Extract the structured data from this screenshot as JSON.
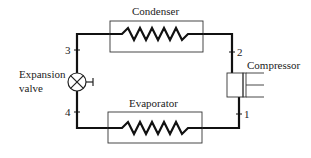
{
  "diagram": {
    "type": "refrigeration-cycle",
    "components": {
      "condenser": "Condenser",
      "evaporator": "Evaporator",
      "compressor": "Compressor",
      "expansion_valve_line1": "Expansion",
      "expansion_valve_line2": "valve"
    },
    "state_points": [
      "1",
      "2",
      "3",
      "4"
    ],
    "colors": {
      "line": "#111111",
      "text": "#222222",
      "background": "#ffffff"
    }
  }
}
